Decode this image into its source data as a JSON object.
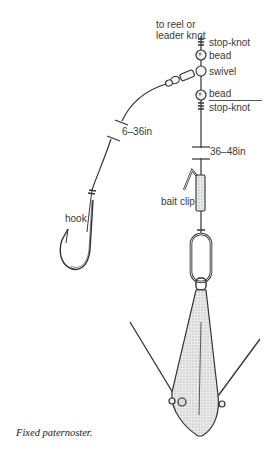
{
  "diagram": {
    "title_caption": "Fixed paternoster.",
    "labels": {
      "reel_line1": "to reel or",
      "reel_line2": "leader knot",
      "stop_knot_top": "stop-knot",
      "bead_top": "bead",
      "swivel": "swivel",
      "bead_bottom": "bead",
      "stop_knot_bottom": "stop-knot",
      "snood_length": "6–36in",
      "trace_length": "36–48in",
      "bait_clip": "bait clip",
      "hook": "hook"
    },
    "components": [
      "main line",
      "stop-knot",
      "bead",
      "three-way swivel",
      "bead",
      "stop-knot",
      "snood",
      "hook",
      "bait clip",
      "link",
      "grip lead weight"
    ],
    "colors": {
      "ink": "#3a3a3a",
      "background": "#ffffff"
    }
  }
}
